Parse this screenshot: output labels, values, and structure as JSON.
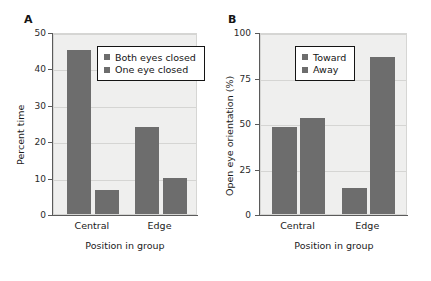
{
  "figure": {
    "background": "#ffffff",
    "bar_color": "#6d6d6d",
    "plot_background": "#efefee",
    "grid_color": "#d5d5d3",
    "axis_color": "#5a5a5a"
  },
  "panels": [
    {
      "letter": "A",
      "legend_items": [
        {
          "label": "Both eyes closed",
          "color": "#6d6d6d"
        },
        {
          "label": "One eye closed",
          "color": "#6d6d6d"
        }
      ]
    },
    {
      "letter": "B",
      "legend_items": [
        {
          "label": "Toward",
          "color": "#6d6d6d"
        },
        {
          "label": "Away",
          "color": "#6d6d6d"
        }
      ]
    }
  ],
  "chart_data": [
    {
      "panel": "A",
      "type": "bar",
      "title": "",
      "categories": [
        "Central",
        "Edge"
      ],
      "series": [
        {
          "name": "Both eyes closed",
          "values": [
            45,
            24
          ],
          "color": "#6d6d6d"
        },
        {
          "name": "One eye closed",
          "values": [
            6.5,
            10
          ],
          "color": "#6d6d6d"
        }
      ],
      "xlabel": "Position in group",
      "ylabel": "Percent time",
      "ylim": [
        0,
        50
      ],
      "yticks": [
        0,
        10,
        20,
        30,
        40,
        50
      ],
      "ytick_labels": [
        "0",
        "10",
        "20",
        "30",
        "40",
        "50"
      ],
      "grid": "horizontal",
      "legend_position": "upper-center"
    },
    {
      "panel": "B",
      "type": "bar",
      "title": "",
      "categories": [
        "Central",
        "Edge"
      ],
      "series": [
        {
          "name": "Toward",
          "values": [
            48,
            14.5
          ],
          "color": "#6d6d6d"
        },
        {
          "name": "Away",
          "values": [
            53,
            86
          ],
          "color": "#6d6d6d"
        }
      ],
      "xlabel": "Position in group",
      "ylabel": "Open eye orientation (%)",
      "ylim": [
        0,
        100
      ],
      "yticks": [
        0,
        25,
        50,
        75,
        100
      ],
      "ytick_labels": [
        "0",
        "25",
        "50",
        "75",
        "100"
      ],
      "grid": "horizontal",
      "legend_position": "upper-center"
    }
  ]
}
